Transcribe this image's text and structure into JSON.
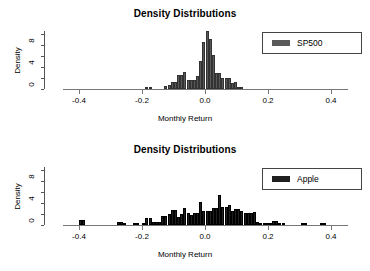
{
  "figure": {
    "panels": [
      {
        "title": "Density Distributions",
        "xlabel": "Monthly Return",
        "ylabel": "Density",
        "legend_label": "SP500",
        "legend_color": "#595959",
        "xticks": [
          "-0.4",
          "-0.2",
          "0.0",
          "0.2",
          "0.4"
        ],
        "yticks": [
          "0",
          "4",
          "8"
        ]
      },
      {
        "title": "Density Distributions",
        "xlabel": "Monthly Return",
        "ylabel": "Density",
        "legend_label": "Apple",
        "legend_color": "#1f1f1f",
        "xticks": [
          "-0.4",
          "-0.2",
          "0.0",
          "0.2",
          "0.4"
        ],
        "yticks": [
          "0",
          "4",
          "8"
        ]
      }
    ]
  },
  "chart_data": [
    {
      "type": "bar",
      "title": "Density Distributions",
      "xlabel": "Monthly Return",
      "ylabel": "Density",
      "legend": [
        "SP500"
      ],
      "legend_position": "top-right",
      "grid": false,
      "bar_color": "#595959",
      "bin_width": 0.01,
      "xlim": [
        -0.45,
        0.45
      ],
      "ylim": [
        0,
        11
      ],
      "xticks": [
        -0.4,
        -0.2,
        0.0,
        0.2,
        0.4
      ],
      "yticks": [
        0,
        4,
        8
      ],
      "bin_centers": [
        -0.185,
        -0.175,
        -0.125,
        -0.115,
        -0.105,
        -0.095,
        -0.085,
        -0.075,
        -0.065,
        -0.055,
        -0.045,
        -0.035,
        -0.025,
        -0.015,
        -0.005,
        0.005,
        0.015,
        0.025,
        0.035,
        0.045,
        0.055,
        0.065,
        0.075,
        0.085,
        0.095,
        0.105,
        0.115
      ],
      "values": [
        0.4,
        0.4,
        0.5,
        0.7,
        1.3,
        1.3,
        2.6,
        2.5,
        3.0,
        1.6,
        1.7,
        1.7,
        2.3,
        5.0,
        8.4,
        10.5,
        9.0,
        6.1,
        2.9,
        2.9,
        2.0,
        1.9,
        1.9,
        1.0,
        1.3,
        0.4,
        0.4
      ]
    },
    {
      "type": "bar",
      "title": "Density Distributions",
      "xlabel": "Monthly Return",
      "ylabel": "Density",
      "legend": [
        "Apple"
      ],
      "legend_position": "top-right",
      "grid": false,
      "bar_color": "#1f1f1f",
      "bin_width": 0.01,
      "xlim": [
        -0.45,
        0.45
      ],
      "ylim": [
        0,
        11
      ],
      "xticks": [
        -0.4,
        -0.2,
        0.0,
        0.2,
        0.4
      ],
      "yticks": [
        0,
        4,
        8
      ],
      "bin_centers": [
        -0.395,
        -0.385,
        -0.275,
        -0.265,
        -0.255,
        -0.225,
        -0.215,
        -0.195,
        -0.185,
        -0.175,
        -0.165,
        -0.155,
        -0.145,
        -0.135,
        -0.125,
        -0.115,
        -0.105,
        -0.095,
        -0.085,
        -0.075,
        -0.065,
        -0.055,
        -0.045,
        -0.035,
        -0.025,
        -0.015,
        -0.005,
        0.005,
        0.015,
        0.025,
        0.035,
        0.045,
        0.055,
        0.065,
        0.075,
        0.085,
        0.095,
        0.105,
        0.115,
        0.125,
        0.135,
        0.145,
        0.155,
        0.165,
        0.175,
        0.185,
        0.195,
        0.205,
        0.215,
        0.225,
        0.235,
        0.245,
        0.305,
        0.315,
        0.365,
        0.375
      ],
      "values": [
        0.9,
        0.9,
        0.5,
        0.6,
        0.3,
        0.2,
        0.2,
        0.3,
        1.2,
        1.2,
        0.6,
        0.5,
        0.6,
        1.6,
        1.6,
        2.0,
        2.7,
        2.7,
        1.5,
        2.0,
        3.1,
        2.1,
        1.8,
        2.2,
        2.2,
        4.1,
        2.5,
        2.5,
        2.6,
        3.1,
        3.1,
        5.5,
        3.2,
        3.2,
        3.6,
        2.6,
        2.8,
        2.8,
        2.5,
        2.2,
        2.2,
        2.2,
        2.3,
        0.6,
        0.4,
        0.3,
        0.3,
        0.3,
        0.8,
        0.8,
        0.2,
        0.2,
        0.2,
        0.2,
        0.3,
        0.3
      ]
    }
  ]
}
